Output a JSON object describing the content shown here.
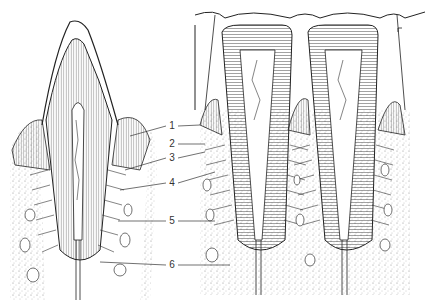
{
  "figure": {
    "labels": [
      {
        "num": "1",
        "x": 172,
        "y": 126
      },
      {
        "num": "2",
        "x": 172,
        "y": 144
      },
      {
        "num": "3",
        "x": 172,
        "y": 158
      },
      {
        "num": "4",
        "x": 172,
        "y": 183
      },
      {
        "num": "5",
        "x": 172,
        "y": 221
      },
      {
        "num": "6",
        "x": 172,
        "y": 265
      }
    ],
    "colors": {
      "line": "#222222",
      "stipple": "#888888",
      "background": "#ffffff"
    }
  }
}
